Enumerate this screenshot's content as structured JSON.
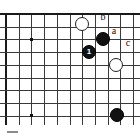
{
  "diagram": {
    "kind": "go-board-diagram",
    "title": "",
    "board": {
      "columns": 10,
      "rows": 9,
      "origin_x": 6,
      "origin_y": 14,
      "spacing": 12.7,
      "edges": [
        "top",
        "left"
      ],
      "line_color": "#3a3a3a",
      "edge_color": "#1a1a1a",
      "background_color": "#ffffff"
    },
    "star_points": [
      {
        "name": "star-point-upper-left",
        "x": 31,
        "y": 39
      },
      {
        "name": "star-point-lower-left",
        "x": 31,
        "y": 115
      }
    ],
    "stones": [
      {
        "name": "white-stone-upper",
        "color": "white",
        "x": 82,
        "y": 24,
        "r": 7,
        "label": ""
      },
      {
        "name": "black-stone-upper",
        "color": "black",
        "x": 103,
        "y": 39,
        "r": 7,
        "label": ""
      },
      {
        "name": "black-stone-move-1",
        "color": "black",
        "x": 89,
        "y": 52,
        "r": 7,
        "label": "1"
      },
      {
        "name": "white-stone-lower",
        "color": "white",
        "x": 116,
        "y": 65,
        "r": 7,
        "label": ""
      },
      {
        "name": "black-stone-bottom",
        "color": "black",
        "x": 117,
        "y": 115,
        "r": 7,
        "label": ""
      }
    ],
    "point_labels": [
      {
        "name": "point-label-b",
        "text": "b",
        "x": 103,
        "y": 17
      },
      {
        "name": "point-label-a",
        "text": "a",
        "x": 114,
        "y": 31
      },
      {
        "name": "point-label-c",
        "text": "c",
        "x": 128,
        "y": 43
      }
    ],
    "caption": {
      "mark_x": 7,
      "mark_y": 131,
      "mark_width": 11,
      "text": ""
    }
  }
}
